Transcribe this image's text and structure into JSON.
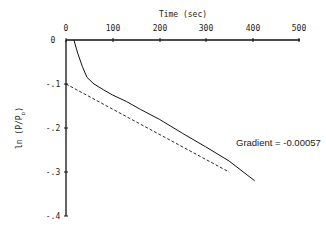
{
  "chart_data": {
    "type": "line",
    "title": "",
    "xlabel": "Time (sec)",
    "ylabel": "ln (P/P_o)",
    "ylabel_main": "ln (P/P",
    "ylabel_sub": "o",
    "ylabel_close": ")",
    "xlim": [
      0,
      500
    ],
    "ylim": [
      -0.4,
      0
    ],
    "x_axis_position": "top",
    "x_ticks": [
      "0",
      "100",
      "200",
      "300",
      "400",
      "500"
    ],
    "y_ticks": [
      "0",
      "-.1",
      "-.2",
      "-.3",
      "-.4"
    ],
    "grid": false,
    "legend": null,
    "series": [
      {
        "name": "measured",
        "style": "solid",
        "x": [
          17,
          25,
          35,
          45,
          60,
          80,
          100,
          130,
          160,
          200,
          250,
          300,
          350,
          405
        ],
        "y": [
          0,
          -0.03,
          -0.06,
          -0.085,
          -0.1,
          -0.113,
          -0.125,
          -0.14,
          -0.158,
          -0.18,
          -0.212,
          -0.243,
          -0.275,
          -0.32
        ]
      },
      {
        "name": "linear fit",
        "style": "dashed",
        "x": [
          0,
          50,
          100,
          150,
          200,
          250,
          300,
          350
        ],
        "y": [
          -0.1,
          -0.128,
          -0.157,
          -0.185,
          -0.214,
          -0.242,
          -0.271,
          -0.3
        ]
      }
    ],
    "annotations": [
      {
        "text": "Gradient = -0.00057",
        "x": 300,
        "y": -0.23
      }
    ]
  }
}
